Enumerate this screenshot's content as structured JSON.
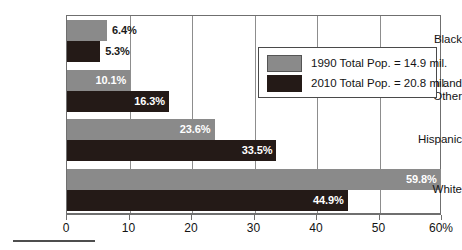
{
  "chart_data": {
    "type": "bar",
    "orientation": "horizontal",
    "title": "",
    "xlabel": "",
    "ylabel": "",
    "xlim": [
      0,
      60
    ],
    "xticks": [
      0,
      10,
      20,
      30,
      40,
      50,
      60
    ],
    "xticklabels": [
      "0",
      "10",
      "20",
      "30",
      "40",
      "50",
      "60%"
    ],
    "grid": true,
    "legend_position": "upper right",
    "categories": [
      "Black",
      "Asian and Other",
      "Hispanic",
      "White"
    ],
    "category_lines": [
      [
        "Black"
      ],
      [
        "Asian and",
        "Other"
      ],
      [
        "Hispanic"
      ],
      [
        "White"
      ]
    ],
    "series": [
      {
        "name": "1990 Total Pop. = 14.9 mil.",
        "color": "#8a8a8a",
        "values": [
          6.4,
          10.1,
          23.6,
          59.8
        ],
        "value_labels": [
          "6.4%",
          "10.1%",
          "23.6%",
          "59.8%"
        ],
        "label_placement": [
          "outside",
          "inside",
          "inside",
          "inside"
        ]
      },
      {
        "name": "2010 Total Pop. = 20.8 mil.",
        "color": "#241a17",
        "values": [
          5.3,
          16.3,
          33.5,
          44.9
        ],
        "value_labels": [
          "5.3%",
          "16.3%",
          "33.5%",
          "44.9%"
        ],
        "label_placement": [
          "outside",
          "inside",
          "inside",
          "inside"
        ]
      }
    ]
  },
  "legend": {
    "entries": [
      {
        "label": "1990 Total Pop. = 14.9 mil.",
        "swatch": "gray"
      },
      {
        "label": "2010 Total Pop. = 20.8 mil.",
        "swatch": "black"
      }
    ]
  }
}
